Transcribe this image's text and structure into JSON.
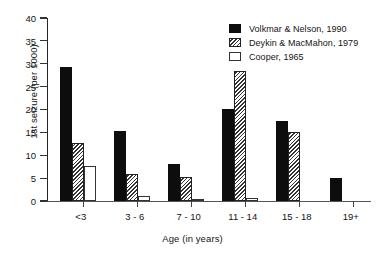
{
  "chart_data": {
    "type": "bar",
    "title": "",
    "xlabel": "Age (in years)",
    "ylabel": "1st seizure (per 1000)",
    "categories": [
      "<3",
      "3 - 6",
      "7 - 10",
      "11 - 14",
      "15 - 18",
      "19+"
    ],
    "series": [
      {
        "name": "Volkmar & Nelson, 1990",
        "style": "solid-black",
        "color": "#0d0d0d",
        "values": [
          29.3,
          15.2,
          8.1,
          20.1,
          17.5,
          5.0
        ]
      },
      {
        "name": "Deykin & MacMahon, 1979",
        "style": "diagonal-hatch",
        "color": "#333333",
        "values": [
          12.6,
          6.0,
          5.2,
          28.4,
          15.0,
          null
        ]
      },
      {
        "name": "Cooper, 1965",
        "style": "open-white",
        "color": "#ffffff",
        "values": [
          7.6,
          1.2,
          0.5,
          0.6,
          null,
          null
        ]
      }
    ],
    "ylim": [
      0,
      40
    ],
    "yticks": [
      0,
      5,
      10,
      15,
      20,
      25,
      30,
      35,
      40
    ],
    "ytick_labels": [
      "0",
      "5",
      "10",
      "15",
      "20",
      "25",
      "30",
      "35",
      "40"
    ],
    "grid": false,
    "legend_position": "top-right"
  }
}
